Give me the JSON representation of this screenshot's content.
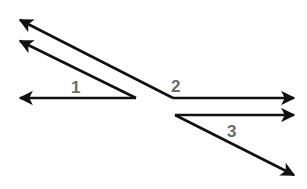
{
  "diagram": {
    "type": "angles",
    "stroke_color": "#111111",
    "label_color": "#6b6b6b",
    "rays": [
      {
        "id": "upper-left-ray-a",
        "from": [
          173,
          98
        ],
        "to": [
          20,
          20
        ]
      },
      {
        "id": "upper-left-ray-b",
        "from": [
          136,
          98
        ],
        "to": [
          20,
          41
        ]
      },
      {
        "id": "left-ray",
        "from": [
          136,
          98
        ],
        "to": [
          20,
          98
        ]
      },
      {
        "id": "right-ray-upper",
        "from": [
          173,
          98
        ],
        "to": [
          294,
          98
        ]
      },
      {
        "id": "right-ray-lower",
        "from": [
          175,
          115
        ],
        "to": [
          294,
          115
        ]
      },
      {
        "id": "diagonal-ray",
        "from": [
          175,
          115
        ],
        "to": [
          294,
          175
        ]
      }
    ],
    "labels": [
      {
        "id": "angle-1",
        "text": "1",
        "x": 71,
        "y": 93
      },
      {
        "id": "angle-2",
        "text": "2",
        "x": 171,
        "y": 92
      },
      {
        "id": "angle-3",
        "text": "3",
        "x": 227,
        "y": 137
      }
    ]
  }
}
